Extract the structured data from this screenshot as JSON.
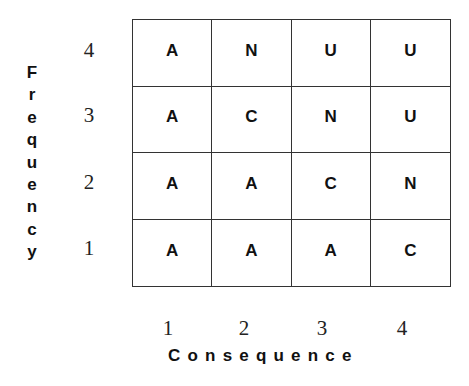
{
  "y_axis": {
    "title": "Frequency",
    "letters": [
      "F",
      "r",
      "e",
      "q",
      "u",
      "e",
      "n",
      "c",
      "y"
    ],
    "tick_labels": [
      "4",
      "3",
      "2",
      "1"
    ]
  },
  "x_axis": {
    "title": "Consequence",
    "tick_labels": [
      "1",
      "2",
      "3",
      "4"
    ]
  },
  "matrix": {
    "rows": [
      {
        "frequency": "4",
        "cells": [
          "A",
          "N",
          "U",
          "U"
        ]
      },
      {
        "frequency": "3",
        "cells": [
          "A",
          "C",
          "N",
          "U"
        ]
      },
      {
        "frequency": "2",
        "cells": [
          "A",
          "A",
          "C",
          "N"
        ]
      },
      {
        "frequency": "1",
        "cells": [
          "A",
          "A",
          "A",
          "C"
        ]
      }
    ]
  },
  "colors": {
    "line": "#333333",
    "text": "#111111",
    "background": "#ffffff"
  }
}
